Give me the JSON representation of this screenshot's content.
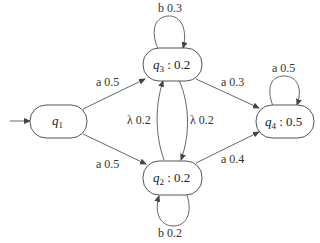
{
  "diagram": {
    "type": "weighted-automaton",
    "nodes": [
      {
        "id": "q1",
        "name": "q",
        "sub": "1",
        "weight": "",
        "initial": true
      },
      {
        "id": "q3",
        "name": "q",
        "sub": "3",
        "weight": " : 0.2"
      },
      {
        "id": "q2",
        "name": "q",
        "sub": "2",
        "weight": " : 0.2"
      },
      {
        "id": "q4",
        "name": "q",
        "sub": "4",
        "weight": " : 0.5"
      }
    ],
    "edges": [
      {
        "from": "q1",
        "to": "q3",
        "label": "a 0.5"
      },
      {
        "from": "q1",
        "to": "q2",
        "label": "a 0.5"
      },
      {
        "from": "q3",
        "to": "q3",
        "label": "b 0.3"
      },
      {
        "from": "q2",
        "to": "q2",
        "label": "b 0.2"
      },
      {
        "from": "q3",
        "to": "q2",
        "label": "λ 0.2"
      },
      {
        "from": "q2",
        "to": "q3",
        "label": "λ 0.2"
      },
      {
        "from": "q3",
        "to": "q4",
        "label": "a 0.3"
      },
      {
        "from": "q2",
        "to": "q4",
        "label": "a 0.4"
      },
      {
        "from": "q4",
        "to": "q4",
        "label": "a 0.5"
      }
    ]
  },
  "colors": {
    "stroke": "#555555",
    "text": "#222222",
    "background": "#ffffff"
  }
}
